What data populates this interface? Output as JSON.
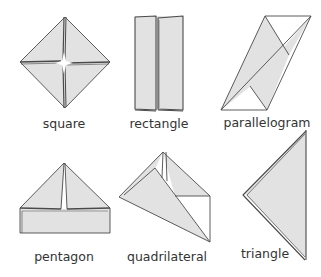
{
  "figure": {
    "shapes": [
      {
        "id": "square",
        "label": "square"
      },
      {
        "id": "rectangle",
        "label": "rectangle"
      },
      {
        "id": "parallelogram",
        "label": "parallelogram"
      },
      {
        "id": "pentagon",
        "label": "pentagon"
      },
      {
        "id": "quadrilateral",
        "label": "quadrilateral"
      },
      {
        "id": "triangle",
        "label": "triangle"
      }
    ],
    "colors": {
      "paper_fill": "#e2e2e2",
      "outline": "#4a4a4a",
      "background": "#ffffff",
      "label_text": "#333333"
    }
  }
}
